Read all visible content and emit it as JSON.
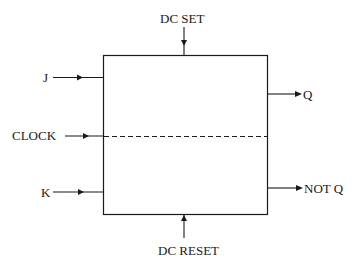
{
  "diagram": {
    "type": "JK flip-flop block",
    "labels": {
      "dc_set": "DC SET",
      "dc_reset": "DC RESET",
      "j": "J",
      "clock": "CLOCK",
      "k": "K",
      "q": "Q",
      "not_q": "NOT Q"
    },
    "colors": {
      "line": "#1a1a1a",
      "background": "#ffffff"
    }
  }
}
